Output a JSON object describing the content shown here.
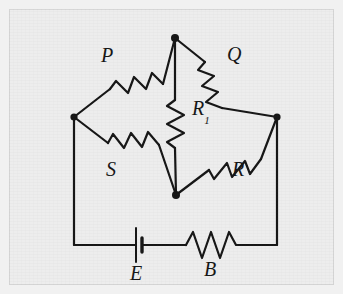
{
  "figure": {
    "type": "circuit-diagram",
    "name": "Wheatstone bridge circuit",
    "background_color": "#ededed",
    "line_color": "#161616",
    "frame_color": "#d7d7d7"
  },
  "labels": {
    "p": "P",
    "q": "Q",
    "s": "S",
    "r": "R",
    "r1_base": "R",
    "r1_sub": "1",
    "e": "E",
    "b": "B"
  },
  "components": [
    {
      "id": "P",
      "kind": "resistor",
      "label": "P",
      "arm": "upper-left",
      "between": [
        "left-node",
        "top-node"
      ]
    },
    {
      "id": "Q",
      "kind": "resistor",
      "label": "Q",
      "arm": "upper-right",
      "between": [
        "top-node",
        "right-node"
      ]
    },
    {
      "id": "S",
      "kind": "resistor",
      "label": "S",
      "arm": "lower-left",
      "between": [
        "left-node",
        "bottom-node"
      ]
    },
    {
      "id": "R",
      "kind": "resistor",
      "label": "R",
      "arm": "lower-right",
      "between": [
        "bottom-node",
        "right-node"
      ]
    },
    {
      "id": "R1",
      "kind": "resistor",
      "label": "R1",
      "arm": "bridge-center",
      "between": [
        "top-node",
        "bottom-node"
      ]
    },
    {
      "id": "E",
      "kind": "battery",
      "label": "E",
      "arm": "bottom-loop",
      "between": [
        "left-rail",
        "bottom-rail"
      ]
    },
    {
      "id": "B",
      "kind": "resistor",
      "label": "B",
      "arm": "bottom-loop",
      "between": [
        "bottom-rail",
        "right-rail"
      ]
    }
  ],
  "nodes": [
    {
      "id": "top-node",
      "x": 175,
      "y": 38,
      "dot": true
    },
    {
      "id": "left-node",
      "x": 74,
      "y": 117,
      "dot": true
    },
    {
      "id": "right-node",
      "x": 277,
      "y": 117,
      "dot": true
    },
    {
      "id": "bottom-node",
      "x": 176,
      "y": 195,
      "dot": true
    }
  ]
}
